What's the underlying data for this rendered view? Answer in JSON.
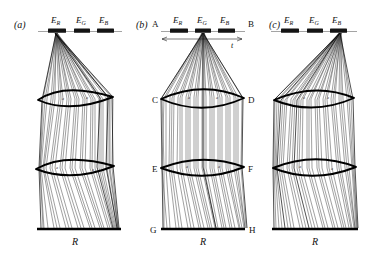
{
  "figure": {
    "background": "#ffffff",
    "ink": "#111111",
    "panels": [
      {
        "id": "a",
        "label": "(a)",
        "source_emitter": "E_R",
        "emitters": [
          {
            "id": "E_R",
            "base": "E",
            "sub": "R"
          },
          {
            "id": "E_G",
            "base": "E",
            "sub": "G"
          },
          {
            "id": "E_B",
            "base": "E",
            "sub": "B"
          }
        ],
        "receiver_label": "R",
        "lens_glyph": "a",
        "corner_labels": [],
        "dimension": null
      },
      {
        "id": "b",
        "label": "(b)",
        "source_emitter": "E_G",
        "emitters": [
          {
            "id": "E_R",
            "base": "E",
            "sub": "R"
          },
          {
            "id": "E_G",
            "base": "E",
            "sub": "G"
          },
          {
            "id": "E_B",
            "base": "E",
            "sub": "B"
          }
        ],
        "receiver_label": "R",
        "lens_glyph": "a",
        "corner_labels": [
          {
            "id": "A",
            "text": "A"
          },
          {
            "id": "B",
            "text": "B"
          },
          {
            "id": "C",
            "text": "C"
          },
          {
            "id": "D",
            "text": "D"
          },
          {
            "id": "E",
            "text": "E"
          },
          {
            "id": "F",
            "text": "F"
          },
          {
            "id": "G",
            "text": "G"
          },
          {
            "id": "H",
            "text": "H"
          }
        ],
        "dimension": {
          "label": "t"
        }
      },
      {
        "id": "c",
        "label": "(c)",
        "source_emitter": "E_B",
        "emitters": [
          {
            "id": "E_R",
            "base": "E",
            "sub": "R"
          },
          {
            "id": "E_G",
            "base": "E",
            "sub": "G"
          },
          {
            "id": "E_B",
            "base": "E",
            "sub": "B"
          }
        ],
        "receiver_label": "R",
        "lens_glyph": "a",
        "corner_labels": [],
        "dimension": null
      }
    ]
  }
}
